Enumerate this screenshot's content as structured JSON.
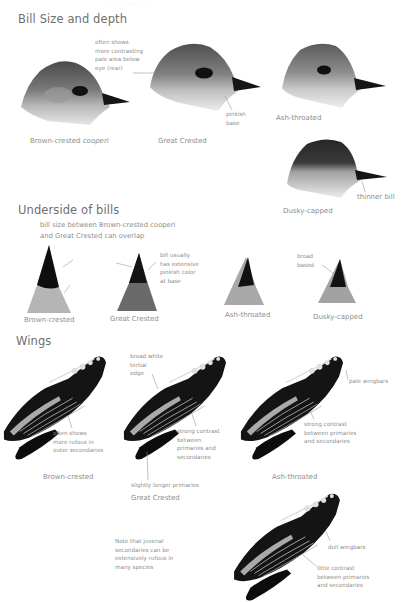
{
  "page": {
    "cropped_header_fragment": "· · · · · · ·"
  },
  "sections": {
    "bill_size": {
      "title": "Bill Size and depth",
      "heads": [
        {
          "name": "Brown-crested",
          "italic_suffix": "cooperi"
        },
        {
          "name": "Great Crested"
        },
        {
          "name": "Ash-throated"
        },
        {
          "name": "Dusky-capped"
        }
      ],
      "annotations": {
        "pale_area": [
          "often shows",
          "more contrasting",
          "pale area below",
          "eye (rear)"
        ],
        "pinkish_base": [
          "pinkish",
          "base"
        ],
        "thinner_bill": "thinner bill"
      }
    },
    "underside": {
      "title": "Underside of bills",
      "overlap_note": [
        "bill size between Brown-crested cooperi",
        "and Great Crested can overlap"
      ],
      "bills": [
        {
          "name": "Brown-crested"
        },
        {
          "name": "Great Crested"
        },
        {
          "name": "Ash-throated"
        },
        {
          "name": "Dusky-capped"
        }
      ],
      "annotations": {
        "pinkish_color": [
          "bill usually",
          "has extensive",
          "pinkish color",
          "at base"
        ],
        "broad_based": [
          "broad",
          "based"
        ]
      }
    },
    "wings": {
      "title": "Wings",
      "wings": [
        {
          "name": "Brown-crested"
        },
        {
          "name": "Great Crested"
        },
        {
          "name": "Ash-throated"
        }
      ],
      "annotations": {
        "rufous_outer": [
          "often shows",
          "more rufous in",
          "outer secondaries"
        ],
        "tertial_edge": [
          "broad white",
          "tertial",
          "edge"
        ],
        "strong_contrast_gc": [
          "strong contrast",
          "between",
          "primaries and",
          "secondaries"
        ],
        "longer_primaries": "slightly longer primaries",
        "pale_wingbars": "pale wingbars",
        "strong_contrast_at": [
          "strong contrast",
          "between primaries",
          "and secondaries"
        ],
        "juvenal_note": [
          "Note that juvenal",
          "secondaries can be",
          "extensively rufous in",
          "many species"
        ],
        "dull_wingbars": "dull wingbars",
        "little_contrast": [
          "little contrast",
          "between primaries",
          "and secondaries"
        ]
      }
    }
  },
  "colors": {
    "text": "#8d8d8d",
    "heading": "#707070",
    "leader_line": "#9a9a9a",
    "bill_black": "#111111",
    "feather_gray": "#8c8c8c"
  }
}
